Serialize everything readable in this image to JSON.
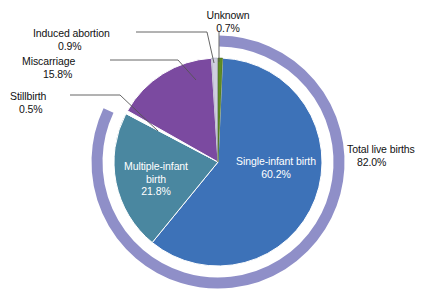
{
  "chart_data": {
    "type": "pie",
    "title": "",
    "subtitle": "",
    "xlabel": "",
    "ylabel": "",
    "units": "percent",
    "total": 100.0,
    "legend_position": "callouts",
    "grid": false,
    "start_angle_deg": 0,
    "direction": "clockwise",
    "categories": [
      "Unknown",
      "Single-infant birth",
      "Multiple-infant birth",
      "Stillbirth",
      "Miscarriage",
      "Induced abortion"
    ],
    "values": [
      0.7,
      60.2,
      21.8,
      0.5,
      15.8,
      0.9
    ],
    "slices": [
      {
        "name": "Unknown",
        "value": 0.7,
        "value_label": "0.7%",
        "color": "#5f8c23",
        "label_placement": "callout",
        "label_side": "top",
        "text_color": "#111111"
      },
      {
        "name": "Single-infant birth",
        "value": 60.2,
        "value_label": "60.2%",
        "color": "#3d72b8",
        "label_placement": "inside",
        "label_side": "right",
        "text_color": "#ffffff"
      },
      {
        "name": "Multiple-infant birth",
        "value": 21.8,
        "value_label": "21.8%",
        "color": "#4a87a0",
        "label_placement": "inside",
        "label_side": "left",
        "text_color": "#ffffff"
      },
      {
        "name": "Stillbirth",
        "value": 0.5,
        "value_label": "0.5%",
        "color": "#ffffff",
        "label_placement": "callout",
        "label_side": "left",
        "text_color": "#111111"
      },
      {
        "name": "Miscarriage",
        "value": 15.8,
        "value_label": "15.8%",
        "color": "#7b4aa0",
        "label_placement": "callout",
        "label_side": "left",
        "text_color": "#111111"
      },
      {
        "name": "Induced abortion",
        "value": 0.9,
        "value_label": "0.9%",
        "color": "#cfcfe0",
        "label_placement": "callout",
        "label_side": "left",
        "text_color": "#111111"
      }
    ],
    "outer_ring": {
      "name": "Total live births",
      "value": 82.0,
      "value_label": "82.0%",
      "color": "#8f8fc8",
      "label_placement": "callout",
      "label_side": "right",
      "text_color": "#111111",
      "composition": [
        "Single-infant birth",
        "Multiple-infant birth"
      ]
    },
    "annotations": [
      {
        "text": "Induced abortion",
        "value_label": "0.9%"
      },
      {
        "text": "Miscarriage",
        "value_label": "15.8%"
      },
      {
        "text": "Stillbirth",
        "value_label": "0.5%"
      },
      {
        "text": "Unknown",
        "value_label": "0.7%"
      },
      {
        "text": "Total live births",
        "value_label": "82.0%"
      },
      {
        "text": "Single-infant birth",
        "value_label": "60.2%"
      },
      {
        "text": "Multiple-infant birth birth",
        "value_label": "21.8%"
      }
    ]
  },
  "labels": {
    "induced_abortion": {
      "name": "Induced abortion",
      "value": "0.9%"
    },
    "miscarriage": {
      "name": "Miscarriage",
      "value": "15.8%"
    },
    "stillbirth": {
      "name": "Stillbirth",
      "value": "0.5%"
    },
    "unknown": {
      "name": "Unknown",
      "value": "0.7%"
    },
    "total_live_births": {
      "name": "Total live births",
      "value": "82.0%"
    },
    "single_infant": {
      "line1": "Single-infant birth",
      "value": "60.2%"
    },
    "multiple_infant": {
      "line1": "Multiple-infant",
      "line2": "birth",
      "value": "21.8%"
    }
  },
  "colors": {
    "single_infant": "#3d72b8",
    "multiple_infant": "#4a87a0",
    "miscarriage": "#7b4aa0",
    "unknown": "#5f8c23",
    "induced_abortion": "#cfcfe0",
    "stillbirth": "#ffffff",
    "outer_ring": "#8f8fc8",
    "background": "#ffffff",
    "text": "#111111",
    "inside_text": "#ffffff",
    "leader_line": "#555555"
  }
}
